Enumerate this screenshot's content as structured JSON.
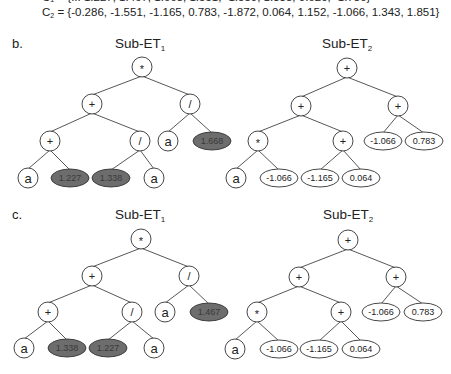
{
  "header": {
    "c1_partial": "C₁ = {... 1.227, 1.467, 1.668, 1.551, -1.589, 1.338, 0.620, -1.780}",
    "c2_label": "C",
    "c2_sub": "2",
    "c2_values": " = {-0.286, -1.551, -1.165, 0.783, -1.872, 0.064, 1.152, -1.066, 1.343, 1.851}"
  },
  "panels": [
    {
      "label": "b.",
      "trees": [
        {
          "title": "Sub-ET",
          "title_sub": "1",
          "nodes": [
            {
              "id": "r",
              "kind": "op",
              "text": "*",
              "x": 142,
              "y": 67
            },
            {
              "id": "l",
              "kind": "op",
              "text": "+",
              "x": 92,
              "y": 104
            },
            {
              "id": "rr",
              "kind": "op",
              "text": "/",
              "x": 190,
              "y": 104
            },
            {
              "id": "ll",
              "kind": "op",
              "text": "+",
              "x": 50,
              "y": 141
            },
            {
              "id": "lr",
              "kind": "op",
              "text": "/",
              "x": 140,
              "y": 141
            },
            {
              "id": "rrl",
              "kind": "var",
              "text": "a",
              "x": 168,
              "y": 141
            },
            {
              "id": "rrr",
              "kind": "hl",
              "text": "1.668",
              "x": 212,
              "y": 141
            },
            {
              "id": "lll",
              "kind": "var",
              "text": "a",
              "x": 28,
              "y": 178
            },
            {
              "id": "llr",
              "kind": "hl",
              "text": "1.227",
              "x": 70,
              "y": 178
            },
            {
              "id": "lrl",
              "kind": "hl",
              "text": "1.338",
              "x": 111,
              "y": 178
            },
            {
              "id": "lrr",
              "kind": "var",
              "text": "a",
              "x": 154,
              "y": 178
            }
          ]
        },
        {
          "title": "Sub-ET",
          "title_sub": "2",
          "nodes": [
            {
              "id": "r",
              "kind": "op",
              "text": "+",
              "x": 347,
              "y": 68
            },
            {
              "id": "l",
              "kind": "op",
              "text": "+",
              "x": 301,
              "y": 106
            },
            {
              "id": "rr",
              "kind": "op",
              "text": "+",
              "x": 398,
              "y": 106
            },
            {
              "id": "ll",
              "kind": "op",
              "text": "*",
              "x": 258,
              "y": 141
            },
            {
              "id": "lr",
              "kind": "op",
              "text": "+",
              "x": 343,
              "y": 141
            },
            {
              "id": "rrl",
              "kind": "const",
              "text": "-1.066",
              "x": 383,
              "y": 141
            },
            {
              "id": "rrr",
              "kind": "const",
              "text": "0.783",
              "x": 424,
              "y": 141
            },
            {
              "id": "lll",
              "kind": "var",
              "text": "a",
              "x": 236,
              "y": 178
            },
            {
              "id": "llr",
              "kind": "const",
              "text": "-1.066",
              "x": 279,
              "y": 178
            },
            {
              "id": "lrl",
              "kind": "const",
              "text": "-1.165",
              "x": 320,
              "y": 178
            },
            {
              "id": "lrr",
              "kind": "const",
              "text": "0.064",
              "x": 361,
              "y": 178
            }
          ]
        }
      ]
    },
    {
      "label": "c.",
      "trees": [
        {
          "title": "Sub-ET",
          "title_sub": "1",
          "nodes": [
            {
              "id": "r",
              "kind": "op",
              "text": "*",
              "x": 141,
              "y": 239
            },
            {
              "id": "l",
              "kind": "op",
              "text": "+",
              "x": 92,
              "y": 276
            },
            {
              "id": "rr",
              "kind": "op",
              "text": "/",
              "x": 189,
              "y": 276
            },
            {
              "id": "ll",
              "kind": "op",
              "text": "+",
              "x": 48,
              "y": 312
            },
            {
              "id": "lr",
              "kind": "op",
              "text": "/",
              "x": 132,
              "y": 312
            },
            {
              "id": "rrl",
              "kind": "var",
              "text": "a",
              "x": 165,
              "y": 312
            },
            {
              "id": "rrr",
              "kind": "hl",
              "text": "1.467",
              "x": 209,
              "y": 312
            },
            {
              "id": "lll",
              "kind": "var",
              "text": "a",
              "x": 24,
              "y": 348
            },
            {
              "id": "llr",
              "kind": "hl",
              "text": "1.338",
              "x": 67,
              "y": 348
            },
            {
              "id": "lrl",
              "kind": "hl",
              "text": "1.227",
              "x": 108,
              "y": 348
            },
            {
              "id": "lrr",
              "kind": "var",
              "text": "a",
              "x": 154,
              "y": 348
            }
          ]
        },
        {
          "title": "Sub-ET",
          "title_sub": "2",
          "nodes": [
            {
              "id": "r",
              "kind": "op",
              "text": "+",
              "x": 348,
              "y": 240
            },
            {
              "id": "l",
              "kind": "op",
              "text": "+",
              "x": 299,
              "y": 277
            },
            {
              "id": "rr",
              "kind": "op",
              "text": "+",
              "x": 396,
              "y": 277
            },
            {
              "id": "ll",
              "kind": "op",
              "text": "*",
              "x": 257,
              "y": 312
            },
            {
              "id": "lr",
              "kind": "op",
              "text": "+",
              "x": 341,
              "y": 312
            },
            {
              "id": "rrl",
              "kind": "const",
              "text": "-1.066",
              "x": 381,
              "y": 312
            },
            {
              "id": "rrr",
              "kind": "const",
              "text": "0.783",
              "x": 423,
              "y": 312
            },
            {
              "id": "lll",
              "kind": "var",
              "text": "a",
              "x": 235,
              "y": 349
            },
            {
              "id": "llr",
              "kind": "const",
              "text": "-1.066",
              "x": 279,
              "y": 349
            },
            {
              "id": "lrl",
              "kind": "const",
              "text": "-1.165",
              "x": 319,
              "y": 349
            },
            {
              "id": "lrr",
              "kind": "const",
              "text": "0.064",
              "x": 361,
              "y": 349
            }
          ]
        }
      ]
    }
  ],
  "edges": [
    [
      "r",
      "l"
    ],
    [
      "r",
      "rr"
    ],
    [
      "l",
      "ll"
    ],
    [
      "l",
      "lr"
    ],
    [
      "rr",
      "rrl"
    ],
    [
      "rr",
      "rrr"
    ],
    [
      "ll",
      "lll"
    ],
    [
      "ll",
      "llr"
    ],
    [
      "lr",
      "lrl"
    ],
    [
      "lr",
      "lrr"
    ]
  ],
  "layout": {
    "panel_label_pos": [
      [
        12,
        48
      ],
      [
        12,
        219
      ]
    ],
    "tree_title_pos": [
      [
        [
          115,
          48
        ],
        [
          322,
          48
        ]
      ],
      [
        [
          115,
          219
        ],
        [
          323,
          219
        ]
      ]
    ]
  },
  "colors": {
    "highlight_fill": "#6d6d6d",
    "node_stroke": "#333333",
    "edge": "#444444"
  }
}
